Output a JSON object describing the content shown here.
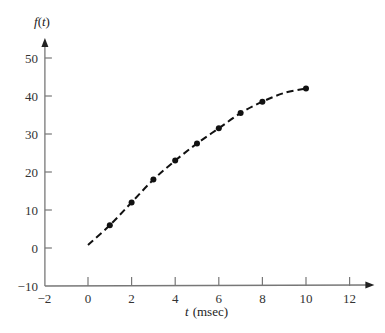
{
  "chart_data": {
    "type": "line",
    "title": "",
    "xlabel": "t (msec)",
    "xlabel_var": "t",
    "xlabel_unit": "(msec)",
    "ylabel": "f(t)",
    "xlim": [
      -2,
      13
    ],
    "ylim": [
      -10,
      55
    ],
    "x_ticks": [
      -2,
      0,
      2,
      4,
      6,
      8,
      10,
      12
    ],
    "y_ticks": [
      -10,
      0,
      10,
      20,
      30,
      40,
      50
    ],
    "grid": false,
    "legend": null,
    "series": [
      {
        "name": "f(t)",
        "style": "dashed curve with dot markers",
        "color": "#111111",
        "curve": [
          [
            0,
            0.8
          ],
          [
            1,
            6
          ],
          [
            2,
            12
          ],
          [
            3,
            18
          ],
          [
            4,
            23
          ],
          [
            5,
            27.5
          ],
          [
            6,
            31.5
          ],
          [
            7,
            35.5
          ],
          [
            8,
            38.5
          ],
          [
            9,
            40.8
          ],
          [
            10,
            42
          ]
        ],
        "points": [
          {
            "x": 1,
            "y": 6
          },
          {
            "x": 2,
            "y": 12
          },
          {
            "x": 3,
            "y": 18
          },
          {
            "x": 4,
            "y": 23
          },
          {
            "x": 5,
            "y": 27.5
          },
          {
            "x": 6,
            "y": 31.5
          },
          {
            "x": 7,
            "y": 35.5
          },
          {
            "x": 8,
            "y": 38.5
          },
          {
            "x": 10,
            "y": 42
          }
        ]
      }
    ]
  },
  "layout": {
    "origin_px": [
      88,
      248
    ],
    "px_per_x_unit": 21.8,
    "px_per_y_unit": 3.8,
    "axis_color": "#777777",
    "line_color": "#111111"
  }
}
